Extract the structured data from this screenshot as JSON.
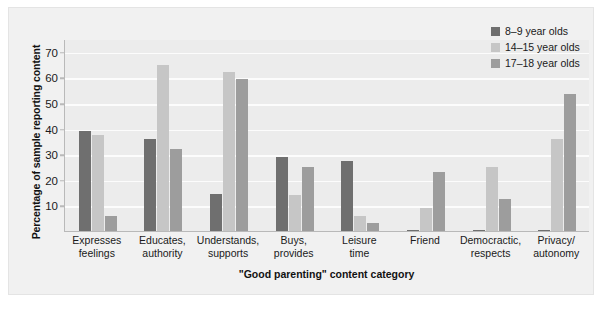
{
  "chart_data": {
    "type": "bar",
    "title": "",
    "xlabel": "\"Good parenting\" content category",
    "ylabel": "Percentage of sample reporting content",
    "ylim": [
      0,
      75
    ],
    "yticks": [
      10,
      20,
      30,
      40,
      50,
      60,
      70
    ],
    "grid": true,
    "legend_position": "top-right",
    "categories": [
      "Expresses feelings",
      "Educates, authority",
      "Understands, supports",
      "Buys, provides",
      "Leisure time",
      "Friend",
      "Democractic, respects",
      "Privacy/ autonomy"
    ],
    "category_lines": [
      [
        "Expresses",
        "feelings"
      ],
      [
        "Educates,",
        "authority"
      ],
      [
        "Understands,",
        "supports"
      ],
      [
        "Buys,",
        "provides"
      ],
      [
        "Leisure",
        "time"
      ],
      [
        "Friend",
        ""
      ],
      [
        "Democractic,",
        "respects"
      ],
      [
        "Privacy/",
        "autonomy"
      ]
    ],
    "series": [
      {
        "name": "8–9 year olds",
        "color": "#6f6f6f",
        "values": [
          39,
          36,
          14.5,
          29,
          27.5,
          0.5,
          0.5,
          0.5
        ]
      },
      {
        "name": "14–15 year olds",
        "color": "#c6c6c6",
        "values": [
          37.5,
          65,
          62,
          14,
          6,
          9,
          25,
          36
        ]
      },
      {
        "name": "17–18 year olds",
        "color": "#9d9d9d",
        "values": [
          6,
          32,
          59.5,
          25,
          3,
          23,
          12.5,
          53.5
        ]
      }
    ]
  },
  "legend": {
    "items": [
      {
        "label": "8–9 year olds",
        "color": "#6f6f6f"
      },
      {
        "label": "14–15 year olds",
        "color": "#c6c6c6"
      },
      {
        "label": "17–18 year olds",
        "color": "#9d9d9d"
      }
    ]
  },
  "colors": {
    "page_background": "#ffffff",
    "panel_background": "#f1f1f1",
    "plot_background": "#ececec",
    "gridline": "#fcfcfc",
    "axis": "#b9b9b9",
    "text": "#1a1a1a"
  }
}
